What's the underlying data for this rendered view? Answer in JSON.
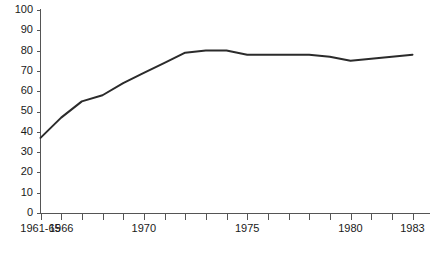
{
  "chart_data": {
    "type": "line",
    "title": "",
    "subtitle": "",
    "xlabel": "",
    "ylabel": "",
    "grid": false,
    "legend": null,
    "ylim": [
      0,
      100
    ],
    "ytick_labels": [
      "0",
      "10",
      "20",
      "30",
      "40",
      "50",
      "60",
      "70",
      "80",
      "90",
      "100"
    ],
    "ytick_values": [
      0,
      10,
      20,
      30,
      40,
      50,
      60,
      70,
      80,
      90,
      100
    ],
    "xtick_labels": [
      "1961-65",
      "1966",
      "1970",
      "1975",
      "1980",
      "1983"
    ],
    "xtick_label_values": [
      "1961-65",
      1966,
      1970,
      1975,
      1980,
      1983
    ],
    "x": [
      "1961-65",
      1966,
      1967,
      1968,
      1969,
      1970,
      1971,
      1972,
      1973,
      1974,
      1975,
      1976,
      1977,
      1978,
      1979,
      1980,
      1981,
      1982,
      1983
    ],
    "values": [
      37,
      47,
      55,
      58,
      64,
      69,
      74,
      79,
      80,
      80,
      78,
      78,
      78,
      78,
      77,
      75,
      76,
      77,
      78
    ],
    "series": [
      {
        "name": "",
        "values": [
          37,
          47,
          55,
          58,
          64,
          69,
          74,
          79,
          80,
          80,
          78,
          78,
          78,
          78,
          77,
          75,
          76,
          77,
          78
        ]
      }
    ],
    "line_color": "#2b2b2b",
    "axis_color": "#555555"
  },
  "caption": {
    "text": ""
  }
}
